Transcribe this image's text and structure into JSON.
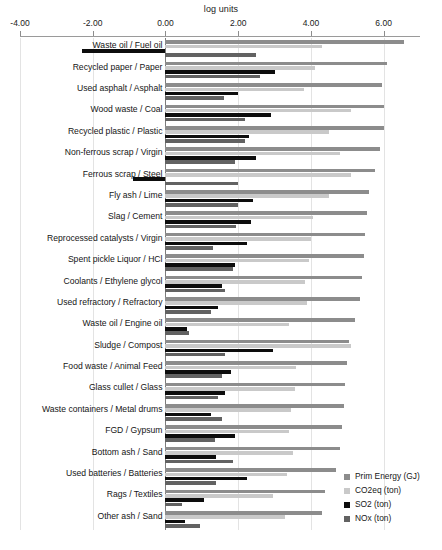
{
  "chart_data": {
    "type": "bar",
    "orientation": "horizontal",
    "title": "",
    "xlabel": "log units",
    "ylabel": "",
    "xlim": [
      -4.0,
      7.0
    ],
    "xticks": [
      -4.0,
      -2.0,
      0.0,
      2.0,
      4.0,
      6.0
    ],
    "xtick_labels": [
      "-4.00",
      "-2.00",
      "0.00",
      "2.00",
      "4.00",
      "6.00"
    ],
    "grid": true,
    "legend_position": "bottom-right",
    "categories": [
      "Waste oil / Fuel oil",
      "Recycled paper / Paper",
      "Used asphalt / Asphalt",
      "Wood waste / Coal",
      "Recycled plastic / Plastic",
      "Non-ferrous scrap / Virgin",
      "Ferrous scrap / Steel",
      "Fly ash / Lime",
      "Slag / Cement",
      "Reprocessed catalysts / Virgin",
      "Spent pickle Liquor / HCl",
      "Coolants / Ethylene glycol",
      "Used refractory / Refractory",
      "Waste oil / Engine oil",
      "Sludge / Compost",
      "Food waste / Animal Feed",
      "Glass cullet / Glass",
      "Waste containers / Metal drums",
      "FGD / Gypsum",
      "Bottom ash / Sand",
      "Used batteries / Batteries",
      "Rags / Textiles",
      "Other ash / Sand"
    ],
    "series": [
      {
        "name": "Prim Energy (GJ)",
        "color": "#8c8c8c",
        "values": [
          6.55,
          6.1,
          5.95,
          6.0,
          6.0,
          5.9,
          5.75,
          5.6,
          5.55,
          5.5,
          5.45,
          5.4,
          5.35,
          5.2,
          5.05,
          5.0,
          4.95,
          4.9,
          4.85,
          4.8,
          4.7,
          4.4,
          4.3
        ]
      },
      {
        "name": "CO2eq (ton)",
        "color": "#c9c9c9",
        "values": [
          4.3,
          4.1,
          3.8,
          5.1,
          4.5,
          4.8,
          5.1,
          4.5,
          4.05,
          4.0,
          3.95,
          3.85,
          3.9,
          3.4,
          5.1,
          3.6,
          3.55,
          3.45,
          3.4,
          3.5,
          3.35,
          2.95,
          3.3
        ]
      },
      {
        "name": "SO2 (ton)",
        "color": "#0d0d0d",
        "values": [
          -2.3,
          3.0,
          2.0,
          2.9,
          2.3,
          2.5,
          -0.9,
          2.4,
          2.35,
          2.25,
          1.9,
          1.55,
          1.45,
          0.6,
          2.95,
          1.8,
          1.65,
          1.25,
          1.9,
          1.4,
          2.25,
          1.05,
          0.55
        ]
      },
      {
        "name": "NOx (ton)",
        "color": "#626262",
        "values": [
          2.5,
          2.6,
          1.6,
          2.2,
          2.2,
          1.9,
          2.0,
          2.0,
          1.95,
          1.3,
          1.85,
          1.65,
          1.25,
          0.65,
          1.65,
          1.55,
          1.45,
          1.55,
          1.35,
          1.85,
          1.4,
          0.45,
          0.95
        ]
      }
    ]
  },
  "legend": {
    "items": [
      {
        "label": "Prim Energy (GJ)",
        "color": "#8c8c8c"
      },
      {
        "label": "CO2eq (ton)",
        "color": "#c9c9c9"
      },
      {
        "label": "SO2 (ton)",
        "color": "#0d0d0d"
      },
      {
        "label": "NOx (ton)",
        "color": "#626262"
      }
    ]
  },
  "caption": ""
}
